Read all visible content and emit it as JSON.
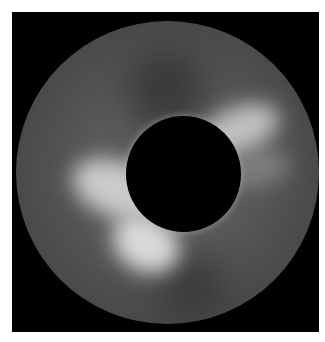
{
  "image": {
    "subject": "solar corona coronagraph image",
    "colors": {
      "frame": "#000000",
      "corona_base": "#5a5a5a",
      "streamer": "#f0f0f0",
      "occulting_disk": "#000000",
      "background": "#ffffff"
    }
  }
}
